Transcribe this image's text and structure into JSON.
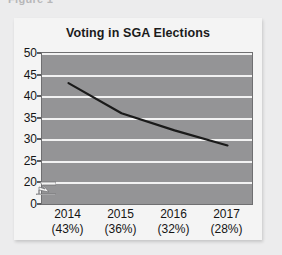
{
  "caption": {
    "text": "Figure 1"
  },
  "figure": {
    "title": "Voting in SGA Elections"
  },
  "chart_data": {
    "type": "line",
    "title": "Voting in SGA Elections",
    "xlabel": "",
    "ylabel": "",
    "categories": [
      "2014",
      "2015",
      "2016",
      "2017"
    ],
    "category_sublabels": [
      "(43%)",
      "(36%)",
      "(32%)",
      "(28%)"
    ],
    "x_tick_labels": [
      "2014\n(43%)",
      "2015\n(36%)",
      "2016\n(32%)",
      "2017\n(28%)"
    ],
    "values": [
      43,
      36,
      32,
      28.5
    ],
    "series": [
      {
        "name": "Voting in SGA Elections",
        "values": [
          43,
          36,
          32,
          28.5
        ]
      }
    ],
    "y_tick_labels": [
      "0",
      "20",
      "25",
      "30",
      "35",
      "40",
      "45",
      "50"
    ],
    "y_ticks": [
      0,
      20,
      25,
      30,
      35,
      40,
      45,
      50
    ],
    "ylim": [
      20,
      50
    ],
    "y_axis_break": true,
    "y_axis_break_between": [
      0,
      20
    ],
    "grid": true,
    "grid_axis": "y",
    "legend": false,
    "legend_position": "none",
    "plot_background": "#949496",
    "grid_color": "#f2f2f2",
    "line_color": "#1a1a1a",
    "figure_background": "#f4f4f4",
    "page_background": "#ececed"
  }
}
